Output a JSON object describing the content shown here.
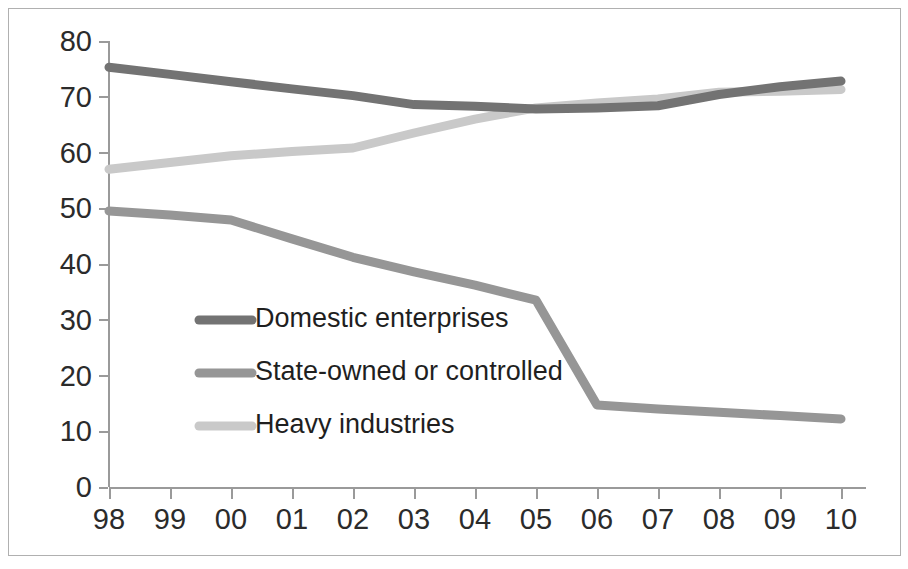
{
  "chart_data": {
    "type": "line",
    "title": "",
    "subtitle": "",
    "xlabel": "",
    "ylabel": "",
    "categories": [
      "98",
      "99",
      "00",
      "01",
      "02",
      "03",
      "04",
      "05",
      "06",
      "07",
      "08",
      "09",
      "10"
    ],
    "x_tick_labels": [
      "98",
      "99",
      "00",
      "01",
      "02",
      "03",
      "04",
      "05",
      "06",
      "07",
      "08",
      "09",
      "10"
    ],
    "y_tick_labels": [
      "0",
      "10",
      "20",
      "30",
      "40",
      "50",
      "60",
      "70",
      "80"
    ],
    "y_ticks": [
      0,
      10,
      20,
      30,
      40,
      50,
      60,
      70,
      80
    ],
    "ylim": [
      0,
      80
    ],
    "xlim_index": [
      0,
      12
    ],
    "grid": false,
    "legend_position": "inside-lower-left",
    "series": [
      {
        "name": "Domestic enterprises",
        "color": "#737373",
        "values": [
          75.3,
          74.0,
          72.7,
          71.4,
          70.2,
          68.6,
          68.3,
          67.8,
          68.0,
          68.4,
          70.4,
          71.8,
          72.8
        ]
      },
      {
        "name": "State-owned or controlled",
        "color": "#969696",
        "values": [
          49.5,
          48.8,
          47.9,
          44.5,
          41.2,
          38.6,
          36.2,
          33.5,
          14.7,
          14.0,
          13.4,
          12.8,
          12.2
        ]
      },
      {
        "name": "Heavy industries",
        "color": "#c9c9c9",
        "values": [
          57.0,
          58.2,
          59.4,
          60.2,
          60.8,
          63.5,
          66.0,
          68.0,
          68.9,
          69.6,
          70.8,
          71.0,
          71.3
        ]
      }
    ],
    "legend": [
      {
        "label": "Domestic enterprises",
        "color": "#737373"
      },
      {
        "label": "State-owned or controlled",
        "color": "#969696"
      },
      {
        "label": "Heavy industries",
        "color": "#c9c9c9"
      }
    ]
  },
  "axis": {
    "axis_color": "#9a9a9a",
    "frame_color": "#b0b0b0",
    "background": "#ffffff",
    "text_color": "#2b2b2b"
  }
}
